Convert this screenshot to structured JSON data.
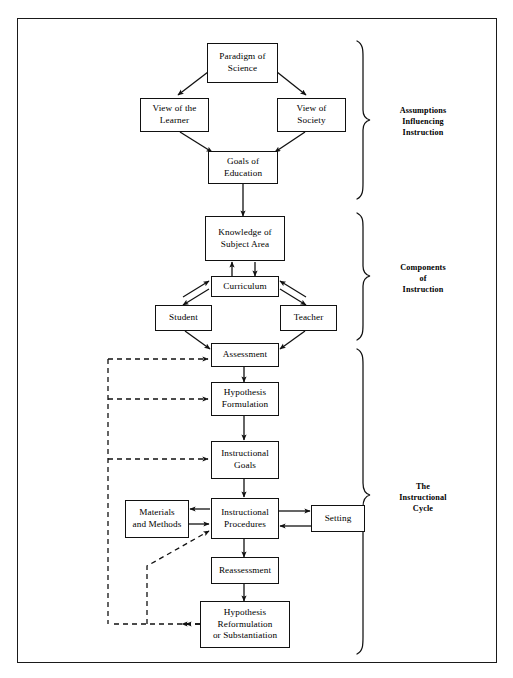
{
  "diagram": {
    "frame": {
      "border_color": "#1a1a1a"
    },
    "nodes": [
      {
        "id": "paradigm",
        "label": "Paradigm of\nScience"
      },
      {
        "id": "view_learner",
        "label": "View of the\nLearner"
      },
      {
        "id": "view_society",
        "label": "View of\nSociety"
      },
      {
        "id": "goals_education",
        "label": "Goals of\nEducation"
      },
      {
        "id": "knowledge",
        "label": "Knowledge of\nSubject Area"
      },
      {
        "id": "curriculum",
        "label": "Curriculum"
      },
      {
        "id": "student",
        "label": "Student"
      },
      {
        "id": "teacher",
        "label": "Teacher"
      },
      {
        "id": "assessment",
        "label": "Assessment"
      },
      {
        "id": "hypothesis_form",
        "label": "Hypothesis\nFormulation"
      },
      {
        "id": "instr_goals",
        "label": "Instructional\nGoals"
      },
      {
        "id": "materials",
        "label": "Materials\nand Methods"
      },
      {
        "id": "instr_proc",
        "label": "Instructional\nProcedures"
      },
      {
        "id": "setting",
        "label": "Setting"
      },
      {
        "id": "reassessment",
        "label": "Reassessment"
      },
      {
        "id": "hypothesis_ref",
        "label": "Hypothesis\nReformulation\nor Substantiation"
      }
    ],
    "groups": [
      {
        "id": "assumptions",
        "label": "Assumptions\nInfluencing\nInstruction"
      },
      {
        "id": "components",
        "label": "Components\nof\nInstruction"
      },
      {
        "id": "cycle",
        "label": "The\nInstructional\nCycle"
      }
    ]
  }
}
